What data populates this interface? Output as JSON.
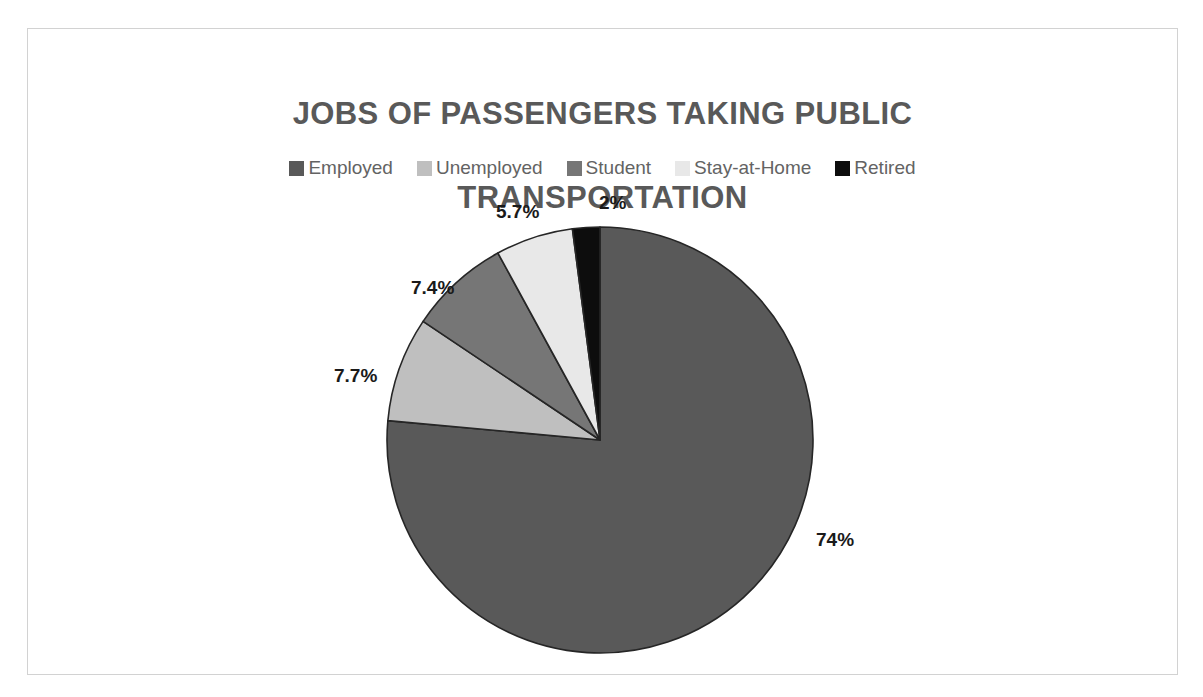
{
  "chart_data": {
    "type": "pie",
    "title": "JOBS OF PASSENGERS TAKING PUBLIC\nTRANSPORTATION",
    "title_line1": "JOBS OF PASSENGERS TAKING PUBLIC",
    "title_line2": "TRANSPORTATION",
    "categories": [
      "Employed",
      "Unemployed",
      "Student",
      "Stay-at-Home",
      "Retired"
    ],
    "values": [
      74,
      7.7,
      7.4,
      5.7,
      2
    ],
    "data_labels": [
      "74%",
      "7.7%",
      "7.4%",
      "5.7%",
      "2%"
    ],
    "colors": [
      "#595959",
      "#bfbfbf",
      "#767676",
      "#e8e8e8",
      "#0d0d0d"
    ],
    "slice_border_color": "#262626",
    "start_angle_deg": 0,
    "direction": "clockwise",
    "legend": {
      "position": "top",
      "entries": [
        {
          "label": "Employed",
          "color": "#595959"
        },
        {
          "label": "Unemployed",
          "color": "#bfbfbf"
        },
        {
          "label": "Student",
          "color": "#767676"
        },
        {
          "label": "Stay-at-Home",
          "color": "#e8e8e8"
        },
        {
          "label": "Retired",
          "color": "#0d0d0d"
        }
      ]
    },
    "xlabel": "",
    "ylabel": "",
    "grid": false
  },
  "labels": {
    "employed": "74%",
    "unemployed": "7.7%",
    "student": "7.4%",
    "stay_at_home": "5.7%",
    "retired": "2%"
  },
  "style": {
    "title_color": "#595959",
    "legend_text_color": "#636363",
    "label_color": "#1a1a1a",
    "frame_color": "#d2d2d2",
    "background": "#ffffff"
  }
}
